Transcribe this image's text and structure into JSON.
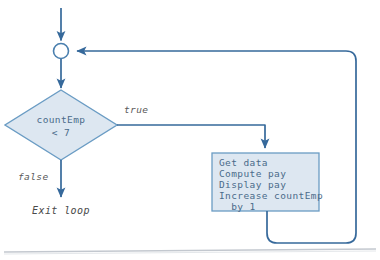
{
  "diagram": {
    "background_color": "#ffffff",
    "stroke_color": "#4a7fae",
    "shape_fill": "#dde7f1",
    "text_color": "#4a6b8a",
    "label_color": "#5a5a5a"
  },
  "nodes": {
    "entry_arrow": {
      "name": "entry-arrow"
    },
    "merge_point": {
      "name": "merge-connector",
      "shape": "circle",
      "fill": "#ffffff"
    },
    "decision": {
      "shape": "diamond",
      "line1": "countEmp",
      "line2": "< 7"
    },
    "process": {
      "shape": "rectangle",
      "lines": [
        "Get data",
        "Compute pay",
        "Display pay",
        "Increase countEmp",
        "  by 1"
      ]
    },
    "exit": {
      "label": "Exit loop"
    }
  },
  "edges": {
    "true_branch": {
      "label": "true"
    },
    "false_branch": {
      "label": "false"
    },
    "loop_back": {
      "label": ""
    }
  },
  "page_rule": {
    "name": "page-edge-line",
    "color": "#b9bfc6"
  }
}
